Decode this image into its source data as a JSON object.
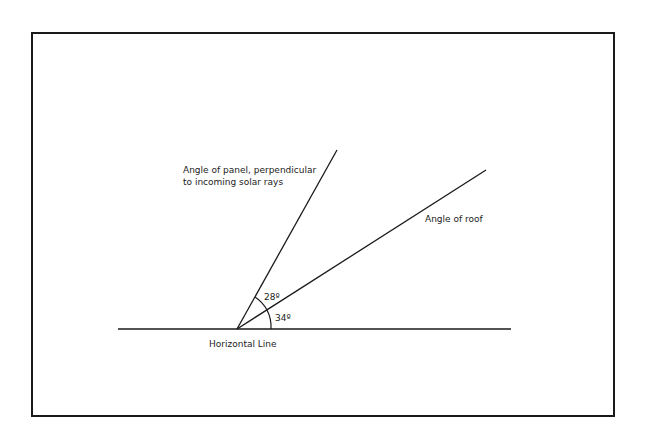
{
  "diagram": {
    "labels": {
      "panel": [
        "Angle of panel, perpendicular",
        "to incoming solar rays"
      ],
      "roof": "Angle of roof",
      "horizontal": "Horizontal Line",
      "angle_panel_roof": "28º",
      "angle_roof_horizontal": "34º"
    },
    "angles_deg": {
      "roof": 34,
      "panel_minus_roof": 28,
      "panel": 62
    },
    "colors": {
      "line": "#1a1a1a",
      "frame": "#1a1a1a",
      "background": "#ffffff"
    }
  }
}
